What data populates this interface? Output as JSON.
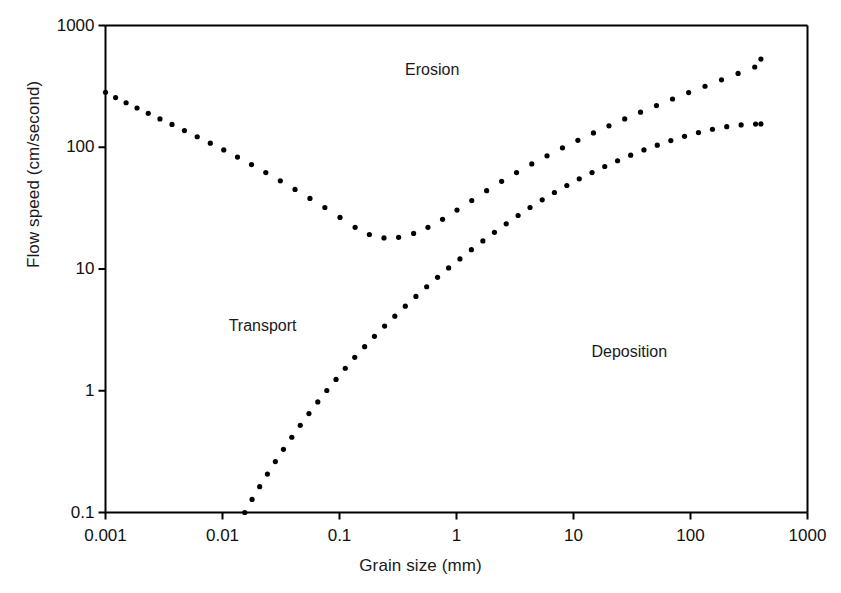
{
  "chart_data": {
    "type": "scatter",
    "title": "",
    "subtitle": "",
    "xlabel": "Grain size (mm)",
    "ylabel": "Flow speed (cm/second)",
    "xscale": "log",
    "yscale": "log",
    "xlim": [
      0.001,
      1000
    ],
    "ylim": [
      0.1,
      1000
    ],
    "grid": false,
    "legend_position": "none",
    "xticks": [
      {
        "value": 0.001,
        "label": "0.001"
      },
      {
        "value": 0.01,
        "label": "0.01"
      },
      {
        "value": 0.1,
        "label": "0.1"
      },
      {
        "value": 1,
        "label": "1"
      },
      {
        "value": 10,
        "label": "10"
      },
      {
        "value": 100,
        "label": "100"
      },
      {
        "value": 1000,
        "label": "1000"
      }
    ],
    "yticks": [
      {
        "value": 0.1,
        "label": "0.1"
      },
      {
        "value": 1,
        "label": "1"
      },
      {
        "value": 10,
        "label": "10"
      },
      {
        "value": 100,
        "label": "100"
      },
      {
        "value": 1000,
        "label": "1000"
      }
    ],
    "annotations": [
      {
        "text": "Erosion",
        "x": 0.62,
        "y": 430
      },
      {
        "text": "Transport",
        "x": 0.022,
        "y": 3.4
      },
      {
        "text": "Deposition",
        "x": 30,
        "y": 2.1
      }
    ],
    "series": [
      {
        "name": "Erosion / critical entrainment velocity",
        "style": "dotted",
        "marker": "dot",
        "color": "#000000",
        "points": [
          [
            0.001,
            283
          ],
          [
            0.00122,
            256
          ],
          [
            0.0015,
            232
          ],
          [
            0.00186,
            210
          ],
          [
            0.00232,
            190
          ],
          [
            0.00292,
            171
          ],
          [
            0.0037,
            154
          ],
          [
            0.00473,
            137
          ],
          [
            0.00608,
            122
          ],
          [
            0.00787,
            108
          ],
          [
            0.01025,
            95
          ],
          [
            0.01343,
            83
          ],
          [
            0.0177,
            72
          ],
          [
            0.02345,
            62
          ],
          [
            0.0312,
            53
          ],
          [
            0.0417,
            45
          ],
          [
            0.0559,
            38
          ],
          [
            0.075,
            32
          ],
          [
            0.101,
            26.5
          ],
          [
            0.136,
            22.0
          ],
          [
            0.18,
            19.2
          ],
          [
            0.24,
            18.0
          ],
          [
            0.32,
            18.2
          ],
          [
            0.43,
            19.6
          ],
          [
            0.57,
            22.0
          ],
          [
            0.76,
            25.6
          ],
          [
            1.01,
            30.5
          ],
          [
            1.35,
            36.5
          ],
          [
            1.81,
            44.0
          ],
          [
            2.43,
            52.5
          ],
          [
            3.26,
            62.0
          ],
          [
            4.4,
            73.0
          ],
          [
            5.94,
            85.0
          ],
          [
            8.05,
            99.0
          ],
          [
            10.9,
            114
          ],
          [
            14.8,
            131
          ],
          [
            20.1,
            150
          ],
          [
            27.4,
            171
          ],
          [
            37.4,
            194
          ],
          [
            51.2,
            220
          ],
          [
            70.2,
            249
          ],
          [
            96.4,
            281
          ],
          [
            133.0,
            317
          ],
          [
            184.0,
            358
          ],
          [
            255.0,
            404
          ],
          [
            354.0,
            456
          ],
          [
            400.0,
            530
          ]
        ]
      },
      {
        "name": "Deposition / settling velocity",
        "style": "dotted",
        "marker": "dot",
        "color": "#000000",
        "points": [
          [
            0.0155,
            0.1
          ],
          [
            0.0179,
            0.128
          ],
          [
            0.0208,
            0.163
          ],
          [
            0.0242,
            0.207
          ],
          [
            0.0283,
            0.262
          ],
          [
            0.0332,
            0.33
          ],
          [
            0.0391,
            0.415
          ],
          [
            0.0462,
            0.52
          ],
          [
            0.0548,
            0.65
          ],
          [
            0.0652,
            0.81
          ],
          [
            0.0779,
            1.005
          ],
          [
            0.0934,
            1.24
          ],
          [
            0.112,
            1.53
          ],
          [
            0.135,
            1.88
          ],
          [
            0.164,
            2.3
          ],
          [
            0.199,
            2.8
          ],
          [
            0.243,
            3.4
          ],
          [
            0.297,
            4.1
          ],
          [
            0.365,
            4.95
          ],
          [
            0.45,
            5.95
          ],
          [
            0.556,
            7.15
          ],
          [
            0.689,
            8.55
          ],
          [
            0.856,
            10.2
          ],
          [
            1.07,
            12.1
          ],
          [
            1.34,
            14.4
          ],
          [
            1.68,
            17.0
          ],
          [
            2.11,
            20.0
          ],
          [
            2.66,
            23.5
          ],
          [
            3.36,
            27.5
          ],
          [
            4.25,
            32.0
          ],
          [
            5.4,
            37.0
          ],
          [
            6.87,
            42.5
          ],
          [
            8.77,
            48.5
          ],
          [
            11.2,
            55.0
          ],
          [
            14.4,
            62.0
          ],
          [
            18.5,
            69.5
          ],
          [
            23.8,
            77.5
          ],
          [
            30.8,
            86.0
          ],
          [
            40.0,
            95.0
          ],
          [
            52.0,
            104.0
          ],
          [
            67.9,
            113.5
          ],
          [
            88.9,
            123.0
          ],
          [
            117.0,
            132.0
          ],
          [
            154.0,
            140.5
          ],
          [
            204.0,
            147.5
          ],
          [
            271.0,
            152.5
          ],
          [
            360.0,
            155.0
          ],
          [
            400.0,
            155.5
          ]
        ]
      }
    ]
  }
}
